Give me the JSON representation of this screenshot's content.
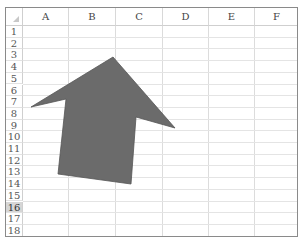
{
  "spreadsheet": {
    "columns": [
      {
        "label": "A",
        "left": 17,
        "width": 46
      },
      {
        "label": "B",
        "left": 63,
        "width": 47
      },
      {
        "label": "C",
        "left": 110,
        "width": 47
      },
      {
        "label": "D",
        "left": 157,
        "width": 46
      },
      {
        "label": "E",
        "left": 203,
        "width": 46
      },
      {
        "label": "F",
        "left": 249,
        "width": 44
      }
    ],
    "rows": [
      "1",
      "2",
      "3",
      "4",
      "5",
      "6",
      "7",
      "8",
      "9",
      "10",
      "11",
      "12",
      "13",
      "14",
      "15",
      "16",
      "17",
      "18"
    ],
    "active_row": "16",
    "row_height": 11.7,
    "header_height": 18
  },
  "shape": {
    "type": "up-arrow",
    "fill": "#6b6b6b",
    "stroke": "#555555",
    "points": "113,57 175,128 136,117 131,184 58,174 66,99 31,107"
  }
}
